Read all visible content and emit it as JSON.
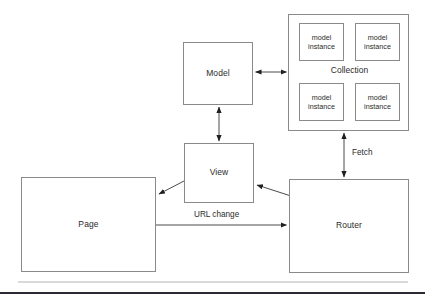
{
  "diagram": {
    "background_color": "#ffffff",
    "box_border_color": "#8a8a8a",
    "text_color": "#2b2b2b",
    "nodes": [
      {
        "id": "model",
        "label": "Model"
      },
      {
        "id": "view",
        "label": "View"
      },
      {
        "id": "page",
        "label": "Page"
      },
      {
        "id": "router",
        "label": "Router"
      },
      {
        "id": "collection",
        "label": "Collection"
      }
    ],
    "collection_instances": [
      {
        "line1": "model",
        "line2": "instance"
      },
      {
        "line1": "model",
        "line2": "instance"
      },
      {
        "line1": "model",
        "line2": "instance"
      },
      {
        "line1": "model",
        "line2": "instance"
      }
    ],
    "edges": [
      {
        "id": "model-collection",
        "from": "model",
        "to": "collection",
        "label": "",
        "arrow": "double"
      },
      {
        "id": "model-view",
        "from": "model",
        "to": "view",
        "label": "",
        "arrow": "double"
      },
      {
        "id": "collection-router",
        "from": "router",
        "to": "collection",
        "label": "Fetch",
        "arrow": "double"
      },
      {
        "id": "view-page",
        "from": "view",
        "to": "page",
        "label": "",
        "arrow": "single"
      },
      {
        "id": "router-view",
        "from": "router",
        "to": "view",
        "label": "",
        "arrow": "single"
      },
      {
        "id": "page-router",
        "from": "page",
        "to": "router",
        "label": "URL change",
        "arrow": "single"
      }
    ],
    "edge_labels": {
      "fetch": "Fetch",
      "url_change": "URL change"
    },
    "rules": {
      "light_color": "#d9d9d9",
      "dark_color": "#2a2a33"
    }
  }
}
